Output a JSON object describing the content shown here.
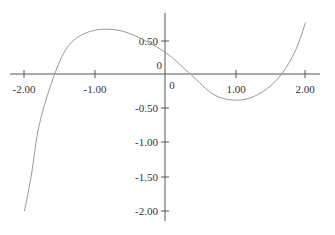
{
  "chart_data": {
    "type": "line",
    "title": "",
    "xlabel": "",
    "ylabel": "",
    "xlim": [
      -2.0,
      2.0
    ],
    "ylim": [
      -2.0,
      0.75
    ],
    "grid": false,
    "legend": null,
    "x_ticks": [
      "-2.00",
      "-1.00",
      "0",
      "1.00",
      "2.00"
    ],
    "y_ticks": [
      "0.50",
      "0",
      "-0.50",
      "-1.00",
      "-1.50",
      "-2.00"
    ],
    "series": [
      {
        "name": "f(x)",
        "color": "#999999",
        "x": [
          -2.0,
          -1.9,
          -1.79,
          -1.57,
          -1.36,
          -1.07,
          -0.74,
          -0.43,
          0.0,
          0.36,
          0.71,
          1.07,
          1.39,
          1.66,
          1.86,
          2.0
        ],
        "y": [
          -2.0,
          -1.46,
          -0.74,
          0.0,
          0.43,
          0.62,
          0.65,
          0.56,
          0.32,
          0.0,
          -0.31,
          -0.38,
          -0.26,
          0.0,
          0.35,
          0.75
        ]
      }
    ]
  },
  "axes": {
    "x_tick_labels": [
      "-2.00",
      "-1.00",
      "0",
      "1.00",
      "2.00"
    ],
    "y_tick_labels": [
      "0.50",
      "0",
      "-0.50",
      "-1.00",
      "-1.50",
      "-2.00"
    ]
  },
  "colors": {
    "axis": "#555555",
    "curve": "#999999",
    "text": "#333333"
  }
}
